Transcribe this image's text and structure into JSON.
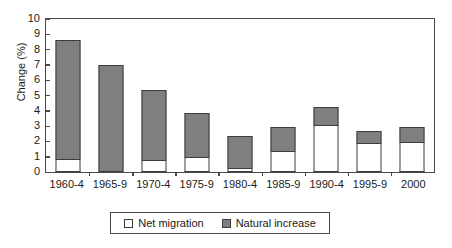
{
  "chart_data": {
    "type": "bar",
    "subtype": "stacked-vertical",
    "title": "",
    "xlabel": "",
    "ylabel": "Change (%)",
    "ylim": [
      0,
      10
    ],
    "ytick_step": 1,
    "yticks": [
      "10",
      "9",
      "8",
      "7",
      "6",
      "5",
      "4",
      "3",
      "2",
      "1",
      "0"
    ],
    "grid": false,
    "legend_position": "bottom",
    "categories": [
      "1960-4",
      "1965-9",
      "1970-4",
      "1975-9",
      "1980-4",
      "1985-9",
      "1990-4",
      "1995-9",
      "2000"
    ],
    "series": [
      {
        "name": "Net migration",
        "color": "#ffffff",
        "values": [
          0.8,
          0.0,
          0.7,
          0.9,
          0.2,
          1.3,
          3.0,
          1.8,
          1.9
        ]
      },
      {
        "name": "Natural increase",
        "color": "#7f7f7f",
        "values": [
          7.8,
          7.0,
          4.65,
          2.95,
          2.15,
          1.65,
          1.25,
          0.85,
          1.05
        ]
      }
    ],
    "totals": [
      8.6,
      7.0,
      5.35,
      3.85,
      2.35,
      2.95,
      4.25,
      2.65,
      2.95
    ]
  },
  "legend": {
    "items": [
      {
        "label": "Net migration",
        "swatch": "white-square-icon"
      },
      {
        "label": "Natural increase",
        "swatch": "gray-square-icon"
      }
    ]
  },
  "colors": {
    "natural_increase": "#7f7f7f",
    "net_migration": "#ffffff",
    "axis": "#4a4a4a",
    "outline": "#3d3d3d",
    "background": "#ffffff"
  }
}
